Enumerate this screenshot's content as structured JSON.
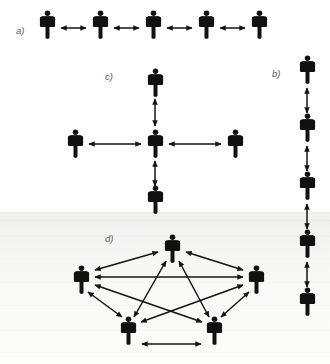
{
  "figure": {
    "width": 330,
    "height": 364,
    "background_color": "#ffffff",
    "figure_color": "#111111",
    "arrow_color": "#141414",
    "label_color": "#5a5a5a"
  },
  "panels": [
    {
      "id": "a",
      "label": "a)",
      "name": "chain-network",
      "label_x": 16,
      "label_y": 34,
      "node_count": 5,
      "edge_count": 4,
      "nodes": [
        {
          "id": "a1",
          "x": 47,
          "y": 27
        },
        {
          "id": "a2",
          "x": 100,
          "y": 27
        },
        {
          "id": "a3",
          "x": 153,
          "y": 27
        },
        {
          "id": "a4",
          "x": 206,
          "y": 27
        },
        {
          "id": "a5",
          "x": 259,
          "y": 27
        }
      ],
      "edges": [
        {
          "from": "a1",
          "to": "a2"
        },
        {
          "from": "a2",
          "to": "a3"
        },
        {
          "from": "a3",
          "to": "a4"
        },
        {
          "from": "a4",
          "to": "a5"
        }
      ]
    },
    {
      "id": "b",
      "label": "b)",
      "name": "vertical-chain-network",
      "label_x": 272,
      "label_y": 77,
      "node_count": 5,
      "edge_count": 4,
      "nodes": [
        {
          "id": "b1",
          "x": 307,
          "y": 71
        },
        {
          "id": "b2",
          "x": 307,
          "y": 129
        },
        {
          "id": "b3",
          "x": 307,
          "y": 187
        },
        {
          "id": "b4",
          "x": 307,
          "y": 245
        },
        {
          "id": "b5",
          "x": 307,
          "y": 303
        }
      ],
      "edges": [
        {
          "from": "b1",
          "to": "b2"
        },
        {
          "from": "b2",
          "to": "b3"
        },
        {
          "from": "b3",
          "to": "b4"
        },
        {
          "from": "b4",
          "to": "b5"
        }
      ]
    },
    {
      "id": "c",
      "label": "c)",
      "name": "star-network",
      "label_x": 105,
      "label_y": 80,
      "node_count": 5,
      "edge_count": 4,
      "nodes": [
        {
          "id": "c-center",
          "x": 155,
          "y": 143
        },
        {
          "id": "c-top",
          "x": 155,
          "y": 82
        },
        {
          "id": "c-bottom",
          "x": 155,
          "y": 199
        },
        {
          "id": "c-left",
          "x": 75,
          "y": 143
        },
        {
          "id": "c-right",
          "x": 235,
          "y": 143
        }
      ],
      "edges": [
        {
          "from": "c-center",
          "to": "c-top"
        },
        {
          "from": "c-center",
          "to": "c-bottom"
        },
        {
          "from": "c-center",
          "to": "c-left"
        },
        {
          "from": "c-center",
          "to": "c-right"
        }
      ]
    },
    {
      "id": "d",
      "label": "d)",
      "name": "fully-connected-network",
      "label_x": 105,
      "label_y": 242,
      "node_count": 5,
      "edge_count": 10,
      "nodes": [
        {
          "id": "d-top",
          "x": 172,
          "y": 248
        },
        {
          "id": "d-left",
          "x": 81,
          "y": 279
        },
        {
          "id": "d-right",
          "x": 256,
          "y": 279
        },
        {
          "id": "d-bottom-left",
          "x": 128,
          "y": 330
        },
        {
          "id": "d-bottom-right",
          "x": 214,
          "y": 330
        }
      ],
      "edges": [
        {
          "from": "d-top",
          "to": "d-left"
        },
        {
          "from": "d-top",
          "to": "d-right"
        },
        {
          "from": "d-top",
          "to": "d-bottom-left"
        },
        {
          "from": "d-top",
          "to": "d-bottom-right"
        },
        {
          "from": "d-left",
          "to": "d-right"
        },
        {
          "from": "d-left",
          "to": "d-bottom-left"
        },
        {
          "from": "d-left",
          "to": "d-bottom-right"
        },
        {
          "from": "d-right",
          "to": "d-bottom-left"
        },
        {
          "from": "d-right",
          "to": "d-bottom-right"
        },
        {
          "from": "d-bottom-left",
          "to": "d-bottom-right"
        }
      ]
    }
  ]
}
